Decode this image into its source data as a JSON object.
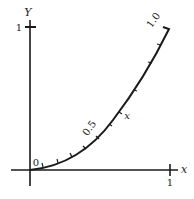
{
  "diagram": {
    "axes": {
      "y_label": "Y",
      "x_label": "x",
      "y_tick_label": "1",
      "x_tick_label": "1",
      "origin_label": "0"
    },
    "curve": {
      "start_label": "0",
      "mid_label": "0.5",
      "end_label": "1.0",
      "variable_label": "x",
      "tick_count": 10
    },
    "colors": {
      "ink": "#1a1a1a",
      "background": "#ffffff"
    }
  }
}
